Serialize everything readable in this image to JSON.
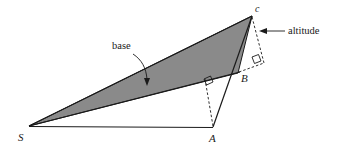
{
  "figure": {
    "type": "geometry-diagram",
    "background_color": "#ffffff",
    "shade_color": "#8a8a8a",
    "stroke_color": "#1a1a1a",
    "width": 342,
    "height": 149
  },
  "vertices": {
    "c": {
      "label": "c",
      "x": 252,
      "y": 15
    },
    "B": {
      "label": "B",
      "x": 238,
      "y": 72
    },
    "A": {
      "label": "A",
      "x": 213,
      "y": 127
    },
    "S": {
      "label": "S",
      "x": 29,
      "y": 126
    }
  },
  "annotations": {
    "base": {
      "label": "base"
    },
    "altitude": {
      "label": "altitude"
    }
  },
  "markers": {
    "right_angle_upper": {
      "name": "right-angle-at-altitude-foot"
    },
    "right_angle_lower": {
      "name": "right-angle-at-base"
    }
  }
}
